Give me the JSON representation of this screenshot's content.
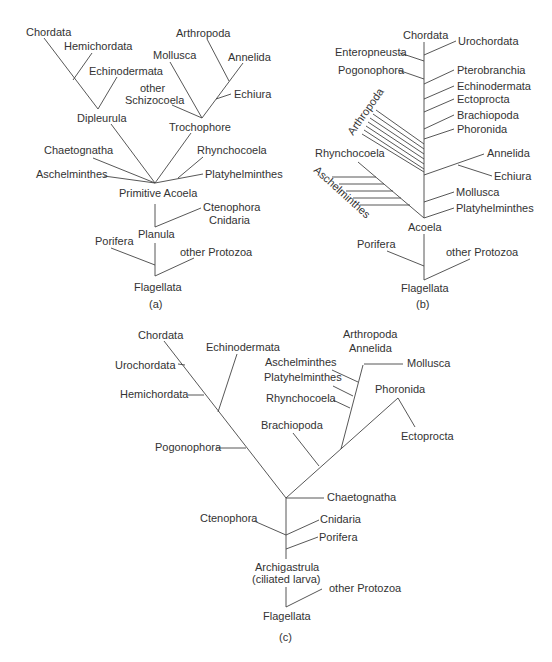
{
  "colors": {
    "ink": "#333333",
    "line": "#444444",
    "background": "#ffffff"
  },
  "panels": {
    "a": {
      "caption": "(a)",
      "labels": {
        "chordata": "Chordata",
        "hemichordata": "Hemichordata",
        "echinodermata": "Echinodermata",
        "dipleurula": "Dipleurula",
        "arthropoda": "Arthropoda",
        "mollusca": "Mollusca",
        "annelida": "Annelida",
        "other": "other",
        "schizocoela": "Schizocoela",
        "echiura": "Echiura",
        "trochophore": "Trochophore",
        "chaetognatha": "Chaetognatha",
        "rhynchocoela": "Rhynchocoela",
        "aschelminthes": "Aschelminthes",
        "platyhelminthes": "Platyhelminthes",
        "primitive_acoela": "Primitive Acoela",
        "ctenophora": "Ctenophora",
        "cnidaria": "Cnidaria",
        "planula": "Planula",
        "porifera": "Porifera",
        "other_protozoa": "other Protozoa",
        "flagellata": "Flagellata"
      }
    },
    "b": {
      "caption": "(b)",
      "labels": {
        "chordata": "Chordata",
        "urochordata": "Urochordata",
        "enteropneusta": "Enteropneusta",
        "pogonophora": "Pogonophora",
        "pterobranchia": "Pterobranchia",
        "echinodermata": "Echinodermata",
        "ectoprocta": "Ectoprocta",
        "brachiopoda": "Brachiopoda",
        "phoronida": "Phoronida",
        "arthropoda": "Arthropoda",
        "rhynchocoela": "Rhynchocoela",
        "annelida": "Annelida",
        "echiura": "Echiura",
        "aschelminthes": "Aschelminthes",
        "mollusca": "Mollusca",
        "platyhelminthes": "Platyhelminthes",
        "acoela": "Acoela",
        "porifera": "Porifera",
        "other_protozoa": "other Protozoa",
        "flagellata": "Flagellata"
      }
    },
    "c": {
      "caption": "(c)",
      "labels": {
        "chordata": "Chordata",
        "echinodermata": "Echinodermata",
        "urochordata": "Urochordata",
        "hemichordata": "Hemichordata",
        "pogonophora": "Pogonophora",
        "arthropoda": "Arthropoda",
        "annelida": "Annelida",
        "mollusca": "Mollusca",
        "aschelminthes": "Aschelminthes",
        "platyhelminthes": "Platyhelminthes",
        "rhynchocoela": "Rhynchocoela",
        "phoronida": "Phoronida",
        "ectoprocta": "Ectoprocta",
        "brachiopoda": "Brachiopoda",
        "chaetognatha": "Chaetognatha",
        "ctenophora": "Ctenophora",
        "cnidaria": "Cnidaria",
        "porifera": "Porifera",
        "archigastrula": "Archigastrula",
        "ciliated_larva": "(ciliated larva)",
        "other_protozoa": "other Protozoa",
        "flagellata": "Flagellata"
      }
    }
  }
}
